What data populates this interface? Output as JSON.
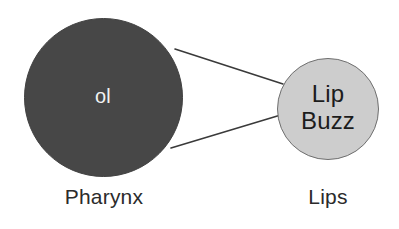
{
  "diagram": {
    "background_color": "#ffffff",
    "nodes": [
      {
        "id": "pharynx",
        "text": "ol",
        "caption": "Pharynx",
        "fill_color": "#474747",
        "text_color": "#f2f2f2",
        "center_x": 103,
        "center_y": 97,
        "diameter": 159
      },
      {
        "id": "lips",
        "text": "Lip\nBuzz",
        "caption": "Lips",
        "fill_color": "#cdcdcd",
        "stroke_color": "#6f6f6f",
        "text_color": "#1c1c1c",
        "center_x": 328,
        "center_y": 109,
        "diameter": 102
      }
    ],
    "connectors": [
      {
        "id": "pharynx-to-lips-upper",
        "from": "pharynx",
        "to": "lips",
        "x1": 175,
        "y1": 49,
        "x2": 283,
        "y2": 84,
        "color": "#3a3a3a",
        "width": 1.6
      },
      {
        "id": "pharynx-to-lips-lower",
        "from": "pharynx",
        "to": "lips",
        "x1": 171,
        "y1": 148,
        "x2": 284,
        "y2": 114,
        "color": "#3a3a3a",
        "width": 1.6
      }
    ]
  }
}
